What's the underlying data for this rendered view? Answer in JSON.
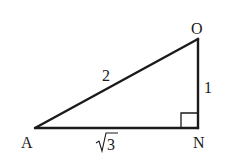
{
  "diagram": {
    "type": "right-triangle",
    "vertices": {
      "A": {
        "label": "A",
        "x": 35,
        "y": 128
      },
      "N": {
        "label": "N",
        "x": 198,
        "y": 128
      },
      "O": {
        "label": "O",
        "x": 198,
        "y": 39
      }
    },
    "sides": {
      "AO": {
        "label": "2"
      },
      "ON": {
        "label": "1"
      },
      "AN": {
        "label": "√3",
        "radicand": "3",
        "radical": "√"
      }
    },
    "right_angle_at": "N",
    "stroke_color": "#1a1a1a",
    "background": "#ffffff"
  }
}
